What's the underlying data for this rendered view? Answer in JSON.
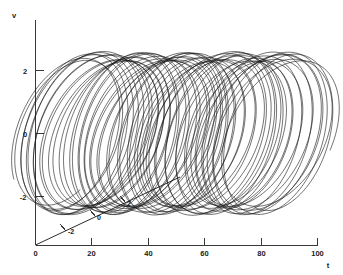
{
  "figure": {
    "background_color": "#ffffff",
    "line_color": "#161616",
    "axis_color": "#3a3a3a"
  },
  "axes": {
    "vertical": {
      "label": "v",
      "ticks": [
        "2",
        "0",
        "-2"
      ],
      "values": [
        2,
        0,
        -2
      ],
      "range": [
        -3.2,
        3.0
      ]
    },
    "horizontal": {
      "label": "t",
      "ticks": [
        "0",
        "20",
        "40",
        "60",
        "80",
        "100"
      ],
      "values": [
        0,
        20,
        40,
        60,
        80,
        100
      ],
      "range": [
        0,
        100
      ]
    },
    "depth": {
      "label": "",
      "ticks": [
        "-2",
        "0",
        "2"
      ],
      "values": [
        -2,
        0,
        2
      ],
      "range": [
        -3,
        3
      ]
    }
  },
  "chart_data": {
    "type": "line",
    "title": "",
    "subtitle": "",
    "xlabel": "t",
    "ylabel": "v",
    "zlabel": "",
    "grid": false,
    "legend": null,
    "legend_position": "none",
    "projection": "pseudo-3d",
    "xlim": [
      0,
      100
    ],
    "ylim": [
      -3.2,
      3.0
    ],
    "zlim": [
      -3,
      3
    ],
    "xticks": [
      0,
      20,
      40,
      60,
      80,
      100
    ],
    "xticklabels": [
      "0",
      "20",
      "40",
      "60",
      "80",
      "100"
    ],
    "yticks": [
      2,
      0,
      -2
    ],
    "yticklabels": [
      "2",
      "0",
      "-2"
    ],
    "zticks": [
      -2,
      0,
      2
    ],
    "zticklabels": [
      "-2",
      "0",
      "2"
    ],
    "series": [
      {
        "name": "trajectory",
        "color": "#161616",
        "t_start": 10.0,
        "t_end": 88.0,
        "n_points": 6400,
        "v_envelope_max": 2.3,
        "v_envelope_min": -2.35,
        "loop_count": 27,
        "fast_period": 2.9,
        "drift_per_loop": 2.85,
        "loop_half_width_t": 3.6,
        "depth_amplitude": 2.25,
        "depth_period": 2.9,
        "depth_phase_offset": 1.5707963
      }
    ],
    "annotations": [
      {
        "text": "-2",
        "axis": "depth",
        "value": -2
      },
      {
        "text": "0",
        "axis": "depth",
        "value": 0
      },
      {
        "text": "2",
        "axis": "depth",
        "value": 2
      }
    ]
  },
  "labels": {
    "y_axis_title": "v",
    "x_axis_title": "t",
    "y_tick_2": "2",
    "y_tick_0": "0",
    "y_tick_neg2": "-2",
    "x_tick_0": "0",
    "x_tick_20": "20",
    "x_tick_40": "40",
    "x_tick_60": "60",
    "x_tick_80": "80",
    "x_tick_100": "100",
    "d_tick_neg2": "-2",
    "d_tick_0": "0",
    "d_tick_2": "2"
  }
}
